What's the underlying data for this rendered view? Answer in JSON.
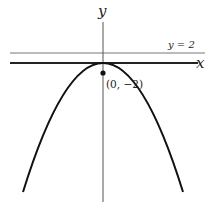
{
  "figure": {
    "axis_labels": {
      "x": "x",
      "y": "y"
    },
    "horizontal_line_label": "y = 2",
    "point_label": "(0, −2)",
    "colors": {
      "curve": "#111111",
      "axis": "#555555",
      "line": "#777777"
    }
  }
}
